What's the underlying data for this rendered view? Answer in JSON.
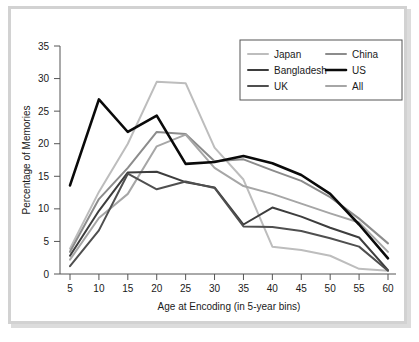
{
  "chart_data": {
    "type": "line",
    "title": "",
    "xlabel": "Age at Encoding (in 5-year bins)",
    "ylabel": "Percentage of Memories",
    "x": [
      5,
      10,
      15,
      20,
      25,
      30,
      35,
      40,
      45,
      50,
      55,
      60
    ],
    "xlim": [
      2.5,
      62.5
    ],
    "ylim": [
      0,
      35
    ],
    "xticks": [
      "5",
      "10",
      "15",
      "20",
      "25",
      "30",
      "35",
      "40",
      "45",
      "50",
      "55",
      "60"
    ],
    "yticks": [
      "0",
      "5",
      "10",
      "15",
      "20",
      "25",
      "30",
      "35"
    ],
    "grid": false,
    "legend_position": "top-right",
    "legend_columns": 2,
    "series": [
      {
        "name": "Japan",
        "color": "#bdbdbd",
        "width": 2.0,
        "values": [
          3.9,
          12.6,
          20.0,
          29.5,
          29.3,
          19.4,
          14.5,
          4.2,
          3.7,
          2.8,
          0.8,
          0.5
        ]
      },
      {
        "name": "China",
        "color": "#8c8c8c",
        "width": 2.0,
        "values": [
          3.4,
          11.5,
          16.3,
          21.8,
          21.5,
          17.3,
          17.6,
          15.9,
          14.3,
          11.8,
          8.5,
          4.7
        ]
      },
      {
        "name": "Bangladesh",
        "color": "#3d3d3d",
        "width": 2.0,
        "values": [
          2.8,
          9.7,
          15.6,
          15.7,
          14.1,
          13.3,
          7.6,
          10.2,
          8.8,
          7.1,
          5.6,
          0.6
        ]
      },
      {
        "name": "US",
        "color": "#0a0a0a",
        "width": 2.6,
        "values": [
          13.6,
          26.8,
          21.8,
          24.3,
          16.9,
          17.2,
          18.1,
          17.0,
          15.2,
          12.3,
          7.6,
          2.4
        ]
      },
      {
        "name": "UK",
        "color": "#4f4f4f",
        "width": 2.0,
        "values": [
          1.2,
          6.7,
          15.4,
          13.0,
          14.2,
          13.2,
          7.3,
          7.2,
          6.6,
          5.5,
          4.2,
          0.5
        ]
      },
      {
        "name": "All",
        "color": "#a6a6a6",
        "width": 2.0,
        "values": [
          2.2,
          8.6,
          12.3,
          19.6,
          21.4,
          16.3,
          13.5,
          12.3,
          10.8,
          9.3,
          7.9,
          3.4
        ]
      }
    ]
  },
  "legend": {
    "entries": [
      {
        "label": "Japan"
      },
      {
        "label": "China"
      },
      {
        "label": "Bangladesh"
      },
      {
        "label": "US"
      },
      {
        "label": "UK"
      },
      {
        "label": "All"
      }
    ]
  },
  "colors": {
    "frame": "#d2d2d2",
    "background": "#ffffff",
    "axis": "#555555",
    "text": "#1a1a1a"
  }
}
